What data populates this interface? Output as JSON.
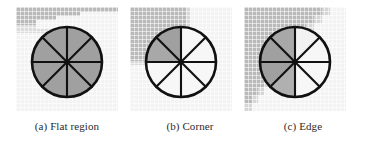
{
  "figure": {
    "kind": "image-patch-descriptor-illustration",
    "panel_count": 3,
    "colors": {
      "patch_light": "#f3f3f3",
      "patch_gray": "#b7b7b7",
      "patch_mid": "#d2d2d2",
      "wedge_gray": "#a0a0a0",
      "wedge_light": "#f7f7f7",
      "outline": "#111111",
      "caption_text": "#2b2b2b",
      "page_background": "#ffffff"
    },
    "wheel": {
      "wedge_count": 8,
      "spoke_count": 8,
      "description": "circular patch divided into eight equal radial wedges"
    }
  },
  "panels": [
    {
      "id": "a",
      "caption": "(a) Flat region",
      "caption_letter": "(a)",
      "caption_label": "Flat region",
      "region_type": "flat",
      "background_description": "uniform light patch with a gray band across the upper-left corner",
      "shaded_wedges": [
        0,
        1,
        2,
        3,
        4,
        5,
        6,
        7
      ],
      "light_wedges": []
    },
    {
      "id": "b",
      "caption": "(b) Corner",
      "caption_letter": "(b)",
      "caption_label": "Corner",
      "region_type": "corner",
      "background_description": "rectangular gray block occupying the upper-left quadrant of the patch",
      "shaded_wedges": [
        5,
        6
      ],
      "light_wedges": [
        0,
        1,
        2,
        3,
        4,
        7
      ]
    },
    {
      "id": "c",
      "caption": "(c) Edge",
      "caption_letter": "(c)",
      "caption_label": "Edge",
      "region_type": "edge",
      "background_description": "diagonal staircase boundary running from top-right to bottom-left, gray on the upper-left side",
      "shaded_wedges": [
        4,
        5,
        6,
        7
      ],
      "light_wedges": [
        0,
        1,
        2,
        3
      ]
    }
  ]
}
